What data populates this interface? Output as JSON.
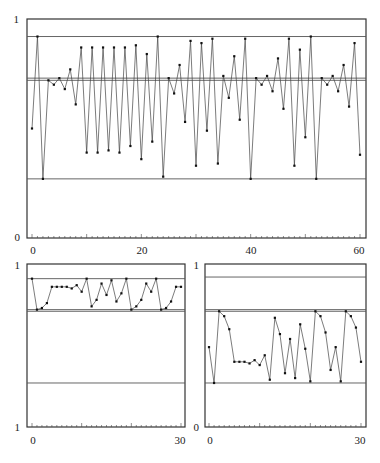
{
  "chart_data": [
    {
      "type": "line",
      "title": "",
      "xlabel": "",
      "ylabel": "",
      "xlim": [
        0,
        60
      ],
      "ylim": [
        0,
        1
      ],
      "x_ticks": [
        0,
        20,
        40,
        60
      ],
      "y_ticks": [
        0,
        1
      ],
      "grid": false,
      "legend": null,
      "reference_lines": [
        0.92,
        0.73,
        0.72,
        0.27
      ],
      "series": [
        {
          "name": "trajectory",
          "x": [
            0,
            1,
            2,
            3,
            4,
            5,
            6,
            7,
            8,
            9,
            10,
            11,
            12,
            13,
            14,
            15,
            16,
            17,
            18,
            19,
            20,
            21,
            22,
            23,
            24,
            25,
            26,
            27,
            28,
            29,
            30,
            31,
            32,
            33,
            34,
            35,
            36,
            37,
            38,
            39,
            40,
            41,
            42,
            43,
            44,
            45,
            46,
            47,
            48,
            49,
            50,
            51,
            52,
            53,
            54,
            55,
            56,
            57,
            58,
            59,
            60
          ],
          "values": [
            0.5,
            0.92,
            0.27,
            0.72,
            0.7,
            0.73,
            0.68,
            0.77,
            0.61,
            0.87,
            0.39,
            0.87,
            0.39,
            0.87,
            0.4,
            0.87,
            0.39,
            0.87,
            0.42,
            0.88,
            0.36,
            0.84,
            0.44,
            0.92,
            0.28,
            0.73,
            0.66,
            0.79,
            0.53,
            0.9,
            0.33,
            0.89,
            0.49,
            0.91,
            0.34,
            0.74,
            0.64,
            0.83,
            0.54,
            0.91,
            0.27,
            0.73,
            0.7,
            0.74,
            0.67,
            0.82,
            0.59,
            0.91,
            0.33,
            0.86,
            0.46,
            0.92,
            0.27,
            0.73,
            0.7,
            0.74,
            0.67,
            0.79,
            0.6,
            0.89,
            0.38
          ]
        }
      ]
    },
    {
      "type": "line",
      "title": "",
      "xlabel": "",
      "ylabel": "",
      "xlim": [
        0,
        30
      ],
      "ylim": [
        1,
        1
      ],
      "y_tick_labels": [
        "1",
        "1"
      ],
      "x_ticks": [
        0,
        30
      ],
      "grid": false,
      "legend": null,
      "reference_lines_px_fraction": [
        0.91,
        0.72,
        0.71,
        0.27
      ],
      "series": [
        {
          "name": "trajectory",
          "x": [
            0,
            1,
            2,
            3,
            4,
            5,
            6,
            7,
            8,
            9,
            10,
            11,
            12,
            13,
            14,
            15,
            16,
            17,
            18,
            19,
            20,
            21,
            22,
            23,
            24,
            25,
            26,
            27,
            28,
            29,
            30
          ],
          "values": [
            0.91,
            0.72,
            0.73,
            0.76,
            0.86,
            0.86,
            0.86,
            0.86,
            0.85,
            0.87,
            0.83,
            0.91,
            0.74,
            0.78,
            0.88,
            0.81,
            0.9,
            0.77,
            0.82,
            0.91,
            0.72,
            0.74,
            0.78,
            0.88,
            0.83,
            0.91,
            0.72,
            0.73,
            0.77,
            0.86,
            0.86
          ]
        }
      ]
    },
    {
      "type": "line",
      "title": "",
      "xlabel": "",
      "ylabel": "",
      "xlim": [
        0,
        30
      ],
      "ylim": [
        0,
        1
      ],
      "x_ticks": [
        0,
        30
      ],
      "y_ticks": [
        0,
        1
      ],
      "grid": false,
      "legend": null,
      "reference_lines": [
        0.92,
        0.72,
        0.71,
        0.27
      ],
      "series": [
        {
          "name": "trajectory",
          "x": [
            0,
            1,
            2,
            3,
            4,
            5,
            6,
            7,
            8,
            9,
            10,
            11,
            12,
            13,
            14,
            15,
            16,
            17,
            18,
            19,
            20,
            21,
            22,
            23,
            24,
            25,
            26,
            27,
            28,
            29,
            30
          ],
          "values": [
            0.49,
            0.27,
            0.71,
            0.68,
            0.6,
            0.4,
            0.4,
            0.4,
            0.39,
            0.41,
            0.38,
            0.44,
            0.29,
            0.67,
            0.57,
            0.33,
            0.54,
            0.3,
            0.63,
            0.48,
            0.28,
            0.71,
            0.68,
            0.58,
            0.35,
            0.49,
            0.28,
            0.71,
            0.68,
            0.61,
            0.4
          ]
        }
      ]
    }
  ],
  "labels": {
    "top": {
      "y_max": "1",
      "y_min": "0",
      "x0": "0",
      "x1": "20",
      "x2": "40",
      "x3": "60"
    },
    "bottom_left": {
      "y_max": "1",
      "y_min": "1",
      "x0": "0",
      "x1": "30"
    },
    "bottom_right": {
      "y_max": "1",
      "y_min": "0",
      "x0": "0",
      "x1": "30"
    }
  }
}
